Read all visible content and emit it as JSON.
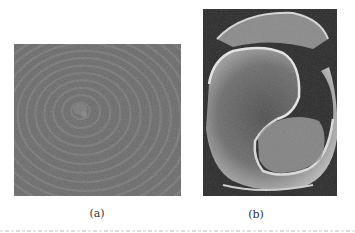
{
  "figure": {
    "panels": [
      {
        "id": "a",
        "label": "(a)",
        "description": "Micrograph of concentric spiral growth terraces (gray)"
      },
      {
        "id": "b",
        "label": "(b)",
        "description": "Micrograph of double spiral growth hillock with bright step edges"
      }
    ],
    "colors": {
      "panel_a_base": "#6a6a6a",
      "panel_b_base": "#555555",
      "background": "#ffffff"
    }
  }
}
